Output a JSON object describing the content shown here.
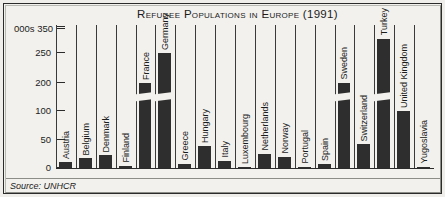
{
  "figure": {
    "source_note": "Source: UNHCR",
    "units_label": "000s"
  },
  "chart_data": {
    "type": "bar",
    "title": "Refugee Populations in Europe (1991)",
    "xlabel": "",
    "ylabel": "000s",
    "ylim": [
      0,
      350
    ],
    "grid": false,
    "legend": false,
    "axis_break": {
      "present": true,
      "note": "Non-linear y-axis: compressed between 100 and 200; break slash drawn across tall bars",
      "tick_positions_px_from_baseline": [
        0,
        28,
        57,
        85,
        115,
        139
      ]
    },
    "yticks": [
      "0",
      "50",
      "100",
      "200",
      "250",
      "350"
    ],
    "categories": [
      "Austria",
      "Belgium",
      "Denmark",
      "Finland",
      "France",
      "Germany",
      "Greece",
      "Hungary",
      "Italy",
      "Luxembourg",
      "Netherlands",
      "Norway",
      "Portugal",
      "Spain",
      "Sweden",
      "Switzerland",
      "Turkey",
      "United Kingdom",
      "Yugoslavia"
    ],
    "values": [
      10,
      17,
      23,
      4,
      200,
      250,
      8,
      40,
      13,
      0,
      25,
      20,
      0,
      8,
      200,
      42,
      310,
      100,
      0
    ],
    "bars_with_break": [
      "France",
      "Germany",
      "Sweden",
      "Turkey"
    ],
    "bar_color": "#2e2e2e",
    "background_color": "#f2f1ed",
    "axis_color": "#2b2b2b"
  }
}
